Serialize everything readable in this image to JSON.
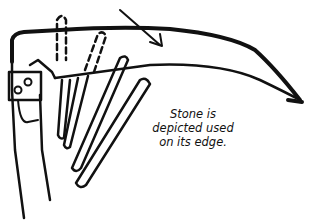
{
  "figure": {
    "caption": [
      "Stone is",
      "depicted used",
      "on its edge."
    ],
    "colors": {
      "ink": "#111111",
      "background": "#ffffff"
    }
  }
}
